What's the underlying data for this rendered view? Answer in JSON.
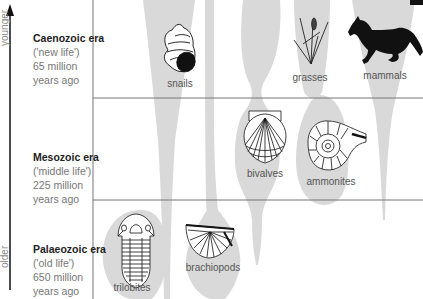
{
  "axis": {
    "top_label": "younger",
    "bottom_label": "older"
  },
  "eras": [
    {
      "name": "Caenozoic era",
      "meaning": "('new life')",
      "age_line1": "65 million",
      "age_line2": "years ago"
    },
    {
      "name": "Mesozoic era",
      "meaning": "('middle life')",
      "age_line1": "225 million",
      "age_line2": "years ago"
    },
    {
      "name": "Palaeozoic era",
      "meaning": "('old life')",
      "age_line1": "650 million",
      "age_line2": "years ago"
    }
  ],
  "groups": {
    "snails": "snails",
    "grasses": "grasses",
    "mammals": "mammals",
    "bivalves": "bivalves",
    "ammonites": "ammonites",
    "trilobites": "trilobites",
    "brachiopods": "brachiopods"
  },
  "colors": {
    "spindle": "#d9d9d9",
    "gridline": "#777777",
    "axis": "#111111"
  }
}
